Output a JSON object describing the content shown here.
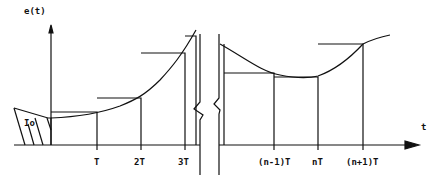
{
  "diagram": {
    "y_axis_label": "e(t)",
    "x_axis_label": "t",
    "initial_label": "Io",
    "left_ticks": [
      "T",
      "2T",
      "3T"
    ],
    "right_ticks": [
      "(n-1)T",
      "nT",
      "(n+1)T"
    ],
    "line_color": "#111111",
    "background": "#ffffff"
  }
}
